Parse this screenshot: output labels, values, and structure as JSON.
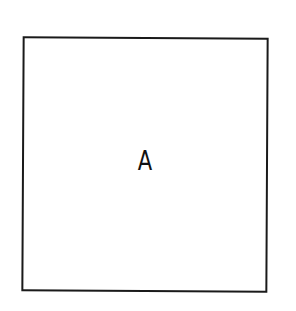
{
  "diagram": {
    "shape": "square",
    "label": "A",
    "stroke_color": "#1a1a1a",
    "background": "#ffffff"
  }
}
